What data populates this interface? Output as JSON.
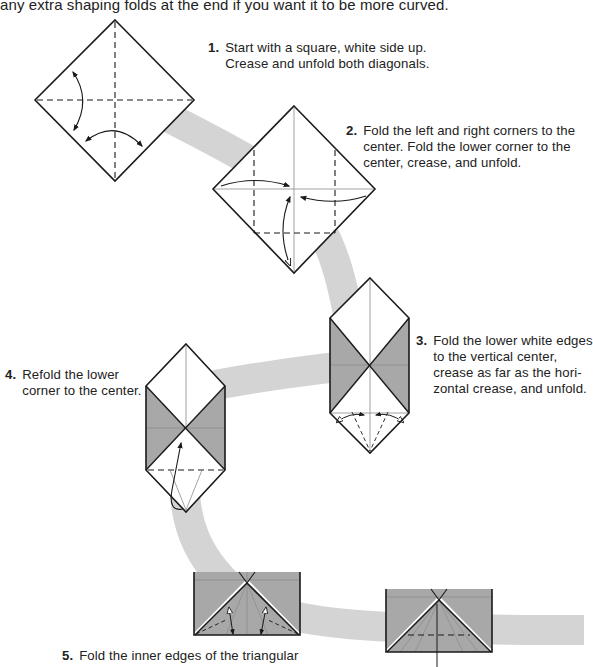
{
  "intro_text": "any extra shaping folds at the end if you want it to be more curved.",
  "colors": {
    "band": "#d4d4d4",
    "paper_color_side": "#a8a8a8",
    "paper_white": "#ffffff",
    "line": "#1a1a1a",
    "crease": "#8a8a8a"
  },
  "steps": [
    {
      "number": "1.",
      "lines": [
        "Start with a square, white side up.",
        "Crease and unfold both diagonals."
      ]
    },
    {
      "number": "2.",
      "lines": [
        "Fold the left and right corners to the",
        "center. Fold the lower corner to the",
        "center, crease, and unfold."
      ]
    },
    {
      "number": "3.",
      "lines": [
        "Fold the lower white edges",
        "to the vertical center,",
        "crease as far as the hori-",
        "zontal crease, and unfold."
      ]
    },
    {
      "number": "4.",
      "lines": [
        "Refold the lower",
        "corner to the center."
      ]
    },
    {
      "number": "5.",
      "lines": [
        "Fold the inner edges of the triangular"
      ]
    }
  ]
}
